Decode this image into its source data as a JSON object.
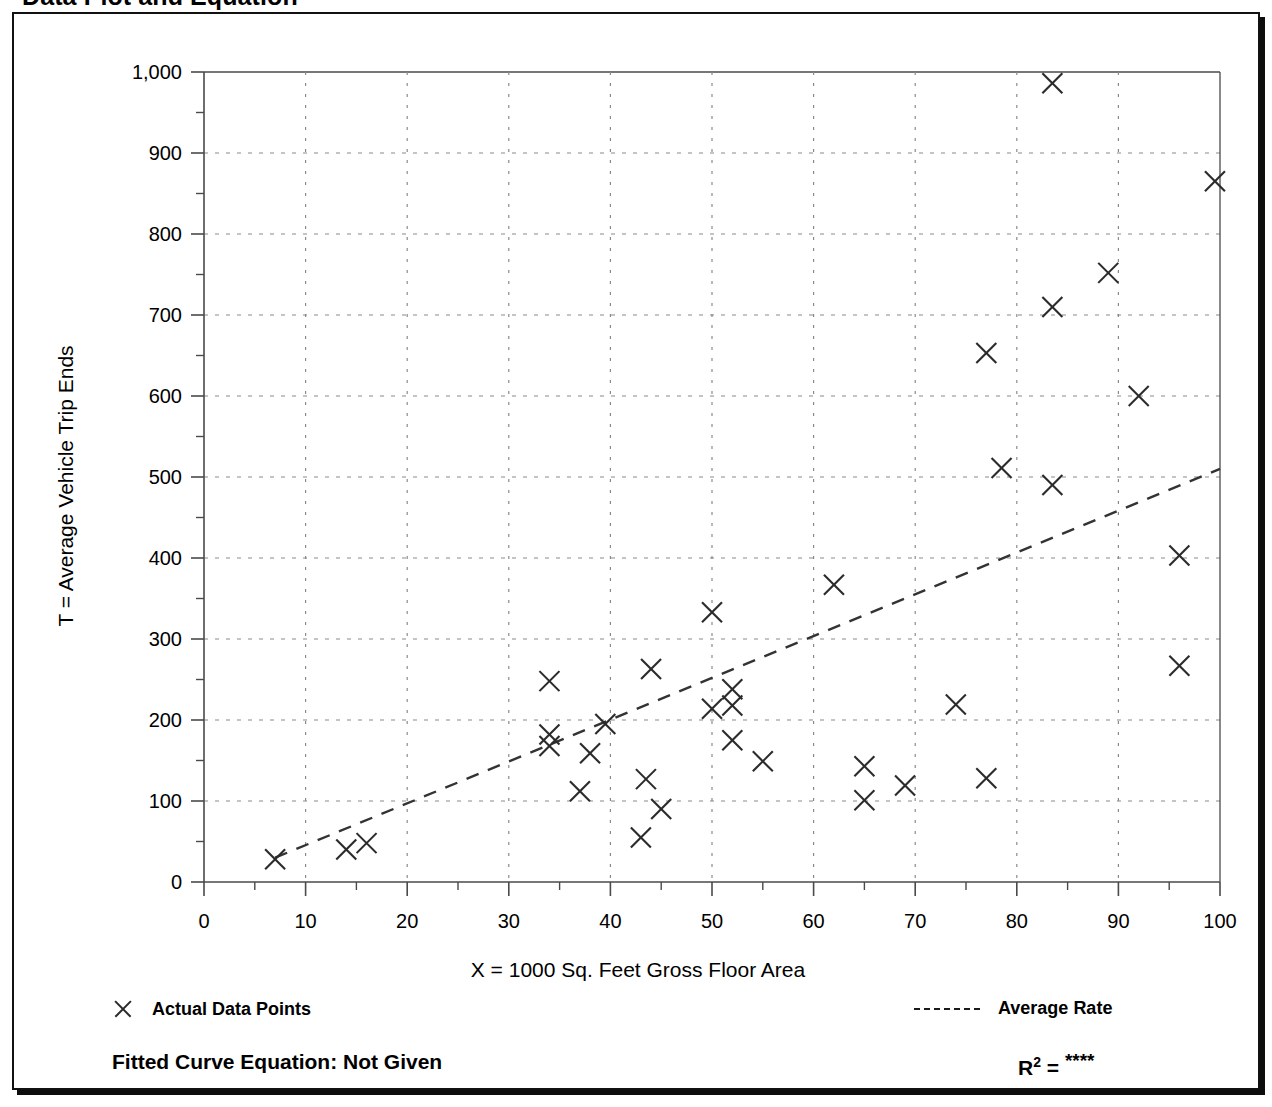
{
  "page": {
    "title": "Data Plot and Equation"
  },
  "legend": {
    "data_points_label": "Actual Data Points",
    "average_rate_label": "Average Rate",
    "marker_icon": "x-marker-icon",
    "line_icon": "dashed-line-icon"
  },
  "equation": {
    "fitted_label": "Fitted Curve Equation:  Not Given",
    "r_squared_base": "R",
    "r_squared_exp": "2",
    "r_squared_eq": " = ",
    "r_squared_value": "****"
  },
  "colors": {
    "frame": "#111111",
    "marker": "#2b2b2b",
    "trendline": "#333333",
    "gridline": "#8a8a8a",
    "axis": "#4a4a4a"
  },
  "chart_data": {
    "type": "scatter",
    "title": "Data Plot and Equation",
    "xlabel": "X = 1000 Sq. Feet Gross Floor Area",
    "ylabel": "T = Average Vehicle Trip Ends",
    "xlim": [
      0,
      100
    ],
    "ylim": [
      0,
      1000
    ],
    "xticks": [
      0,
      10,
      20,
      30,
      40,
      50,
      60,
      70,
      80,
      90,
      100
    ],
    "xtick_labels": [
      "0",
      "10",
      "20",
      "30",
      "40",
      "50",
      "60",
      "70",
      "80",
      "90",
      "100"
    ],
    "xminor_step": 5,
    "yticks": [
      0,
      100,
      200,
      300,
      400,
      500,
      600,
      700,
      800,
      900,
      1000
    ],
    "ytick_labels": [
      "0",
      "100",
      "200",
      "300",
      "400",
      "500",
      "600",
      "700",
      "800",
      "900",
      "1,000"
    ],
    "yminor_step": 50,
    "grid": "dotted-both-axes",
    "legend_position": "below-plot",
    "series": [
      {
        "name": "Actual Data Points",
        "marker": "x",
        "points": [
          [
            7,
            28
          ],
          [
            14,
            40
          ],
          [
            16,
            48
          ],
          [
            34,
            248
          ],
          [
            34,
            182
          ],
          [
            34,
            168
          ],
          [
            37,
            112
          ],
          [
            38,
            159
          ],
          [
            39.5,
            195
          ],
          [
            43,
            55
          ],
          [
            43.5,
            127
          ],
          [
            44,
            263
          ],
          [
            45,
            90
          ],
          [
            50,
            333
          ],
          [
            50,
            214
          ],
          [
            52,
            238
          ],
          [
            52,
            218
          ],
          [
            52,
            175
          ],
          [
            55,
            149
          ],
          [
            62,
            367
          ],
          [
            65,
            143
          ],
          [
            65,
            101
          ],
          [
            69,
            119
          ],
          [
            74,
            219
          ],
          [
            77,
            128
          ],
          [
            77,
            653
          ],
          [
            78.5,
            511
          ],
          [
            83.5,
            986
          ],
          [
            83.5,
            710
          ],
          [
            83.5,
            490
          ],
          [
            89,
            752
          ],
          [
            92,
            600
          ],
          [
            96,
            403
          ],
          [
            96,
            267
          ],
          [
            99.5,
            865
          ]
        ]
      },
      {
        "name": "Average Rate",
        "type": "line",
        "style": "dashed",
        "points": [
          [
            7,
            30
          ],
          [
            100,
            510
          ]
        ]
      }
    ]
  }
}
